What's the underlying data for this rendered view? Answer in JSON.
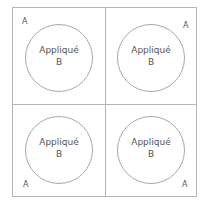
{
  "cells": [
    {
      "position": "top-left",
      "circle_label": "Appliqué",
      "circle_sublabel": "B",
      "corner_label": "A"
    },
    {
      "position": "top-right",
      "circle_label": "Appliqué",
      "circle_sublabel": "B",
      "corner_label": "A"
    },
    {
      "position": "bottom-left",
      "circle_label": "Appliqué",
      "circle_sublabel": "B",
      "corner_label": "A"
    },
    {
      "position": "bottom-right",
      "circle_label": "Appliqué",
      "circle_sublabel": "B",
      "corner_label": "A"
    }
  ],
  "colors": {
    "line": "#b5b5b5",
    "text": "#555555",
    "background": "#ffffff"
  }
}
